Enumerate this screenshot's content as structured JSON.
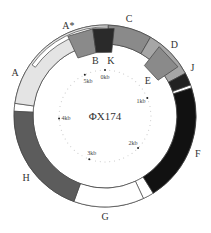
{
  "title": "ΦX174",
  "genome_length_kb": 5.386,
  "colors": {
    "outline": "#444444",
    "white": "#ffffff",
    "light": "#e4e4e4",
    "mid": "#8a8a8a",
    "dark": "#5c5c5c",
    "black": "#111111"
  },
  "genes": [
    {
      "name": "C",
      "start_deg": 2,
      "end_deg": 30,
      "fill": "#8a8a8a",
      "track": "outer",
      "label_deg": 14
    },
    {
      "name": "D",
      "start_deg": 30,
      "end_deg": 62,
      "fill": "#a6a6a6",
      "track": "outer",
      "label_deg": 44
    },
    {
      "name": "E",
      "start_deg": 38,
      "end_deg": 56,
      "fill": "#8a8a8a",
      "track": "inner-box",
      "label_deg": 50
    },
    {
      "name": "J",
      "start_deg": 62,
      "end_deg": 70,
      "fill": "#222222",
      "track": "outer",
      "label_deg": 61
    },
    {
      "name": "F",
      "start_deg": 72,
      "end_deg": 148,
      "fill": "#111111",
      "track": "outer",
      "label_deg": 112
    },
    {
      "name": "G",
      "start_deg": 155,
      "end_deg": 200,
      "fill": "#ffffff",
      "track": "outer",
      "label_deg": 180
    },
    {
      "name": "H",
      "start_deg": 200,
      "end_deg": 273,
      "fill": "#5c5c5c",
      "track": "outer",
      "label_deg": 232
    },
    {
      "name": "A",
      "start_deg": 278,
      "end_deg": 362,
      "fill": "#e4e4e4",
      "track": "outer",
      "label_deg": 296
    },
    {
      "name": "A*",
      "start_deg": 305,
      "end_deg": 362,
      "fill": "#ffffff",
      "track": "outer-strip",
      "label_deg": 338
    },
    {
      "name": "B",
      "start_deg": 335,
      "end_deg": 352,
      "fill": "#8a8a8a",
      "track": "inner-box",
      "label_deg": 350
    },
    {
      "name": "K",
      "start_deg": 352,
      "end_deg": 366,
      "fill": "#2a2a2a",
      "track": "inner-box",
      "label_deg": 6
    }
  ],
  "gaps": [
    {
      "start_deg": 70,
      "end_deg": 72
    },
    {
      "start_deg": 148,
      "end_deg": 155
    },
    {
      "start_deg": 273,
      "end_deg": 278
    }
  ],
  "ticks": [
    {
      "label": "0kb",
      "deg": 0
    },
    {
      "label": "1kb",
      "deg": 67
    },
    {
      "label": "2kb",
      "deg": 134
    },
    {
      "label": "3kb",
      "deg": 200
    },
    {
      "label": "4kb",
      "deg": 267
    },
    {
      "label": "5kb",
      "deg": 334
    }
  ]
}
